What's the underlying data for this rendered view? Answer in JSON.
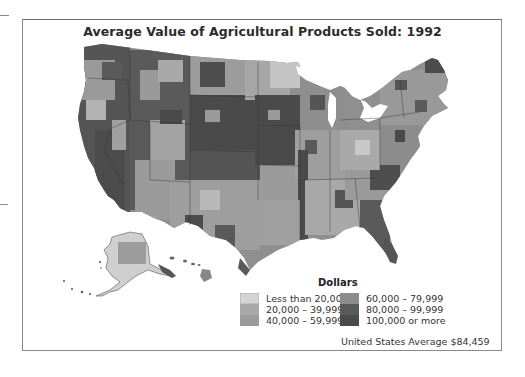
{
  "title": "Average Value of Agricultural Products Sold: 1992",
  "legend": {
    "title": "Dollars",
    "items": [
      {
        "label": "Less than 20,000",
        "color": "#d4d4d4"
      },
      {
        "label": "20,000 – 39,999",
        "color": "#a9a9a9"
      },
      {
        "label": "40,000 – 59,999",
        "color": "#9b9b9b"
      },
      {
        "label": "60,000 – 79,999",
        "color": "#8c8c8c"
      },
      {
        "label": "80,000 – 99,999",
        "color": "#5a5a5a"
      },
      {
        "label": "100,000 or more",
        "color": "#4a4a4a"
      }
    ]
  },
  "average_note": "United States Average $84,459",
  "map": {
    "region": "United States (by county)",
    "insets": [
      "Alaska",
      "Hawaii"
    ]
  }
}
